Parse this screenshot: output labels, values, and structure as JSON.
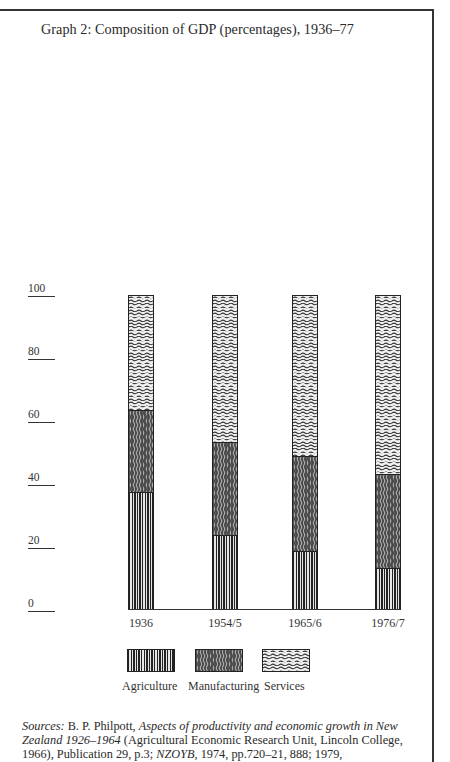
{
  "title": "Graph 2:  Composition of GDP (percentages), 1936–77",
  "colors": {
    "frame": "#333333",
    "ink": "#222222",
    "paper": "#ffffff"
  },
  "y_axis": {
    "ticks": [
      {
        "label": "100",
        "value": 100
      },
      {
        "label": "80",
        "value": 80
      },
      {
        "label": "60",
        "value": 60
      },
      {
        "label": "40",
        "value": 40
      },
      {
        "label": "20",
        "value": 20
      },
      {
        "label": "0",
        "value": 0
      }
    ]
  },
  "x_axis": {
    "labels": [
      "1936",
      "1954/5",
      "1965/6",
      "1976/7"
    ]
  },
  "legend": {
    "items": [
      {
        "label": "Agriculture",
        "pattern": "vertical-lines"
      },
      {
        "label": "Manufacturing",
        "pattern": "vertical-wavy-lines"
      },
      {
        "label": "Services",
        "pattern": "horizontal-wavy-lines"
      }
    ]
  },
  "sources": {
    "prefix": "Sources:",
    "author": " B. P. Philpott, ",
    "book_title": "Aspects of productivity and economic growth in New Zealand 1926–1964",
    "publisher": " (Agricultural Economic Research Unit, Lincoln College, 1966), Publication 29, p.3; ",
    "yearbook": "NZOYB",
    "tail": ", 1974, pp.720–21, 888; 1979,"
  },
  "chart_data": {
    "type": "bar",
    "stacked": true,
    "title": "Graph 2:  Composition of GDP (percentages), 1936–77",
    "xlabel": "",
    "ylabel": "",
    "ylim": [
      0,
      100
    ],
    "yticks": [
      0,
      20,
      40,
      60,
      80,
      100
    ],
    "grid": false,
    "legend_position": "bottom",
    "categories": [
      "1936",
      "1954/5",
      "1965/6",
      "1976/7"
    ],
    "series": [
      {
        "name": "Agriculture",
        "values": [
          37.5,
          23.5,
          18.5,
          13
        ]
      },
      {
        "name": "Manufacturing",
        "values": [
          26,
          30,
          30.5,
          30
        ]
      },
      {
        "name": "Services",
        "values": [
          36.5,
          46.5,
          51,
          57
        ]
      }
    ]
  }
}
